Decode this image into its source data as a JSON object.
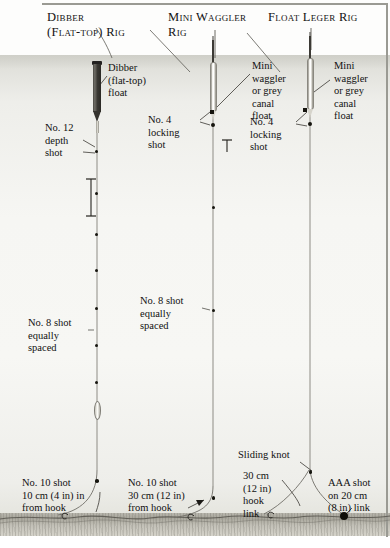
{
  "figure": {
    "kind": "angling-rig-diagram",
    "titles": [
      {
        "id": "dibber",
        "text": "Dibber\n(Flat-top) Rig"
      },
      {
        "id": "mini-waggler",
        "text": "Mini Waggler\nRig"
      },
      {
        "id": "float-leger",
        "text": "Float Leger Rig"
      }
    ]
  },
  "labels": {
    "dibber_float": "Dibber\n(flat-top)\nfloat",
    "no12_depth_shot": "No. 12\ndepth\nshot",
    "no8_shot_left": "No. 8 shot\nequally\nspaced",
    "no8_shot_mid": "No. 8 shot\nequally\nspaced",
    "no10_shot_left": "No. 10 shot\n10 cm (4 in) in\nfrom hook",
    "no10_shot_mid": "No. 10 shot\n30 cm (12 in)\nfrom hook",
    "mini_waggler_left": "Mini\nwaggler\nor grey\ncanal\nfloat",
    "mini_waggler_right": "Mini\nwaggler\nor grey\ncanal\nfloat",
    "no4_locking_left": "No. 4\nlocking\nshot",
    "no4_locking_right": "No. 4\nlocking\nshot",
    "sliding_knot": "Sliding knot",
    "hook_link": "30 cm\n(12 in)\nhook\nlink",
    "aaa_shot": "AAA shot\non 20 cm\n(8 in) link"
  },
  "colors": {
    "ink": "#111111",
    "line": "#8e8c85",
    "shot": "#16150f",
    "water_top": "#dcdcd6",
    "water_mid": "#f7f7f4",
    "bed": "#a9a79d",
    "float_dark": "#35332e",
    "float_light": "#ffffff"
  },
  "rigs": [
    {
      "name": "dibber-flat-top-rig",
      "line_x": 97,
      "line_top": 62,
      "line_bottom": 520,
      "float": {
        "type": "dibber-flat-top",
        "top": 61,
        "bottom": 133
      },
      "shots": [
        {
          "name": "no-12-depth-shot",
          "y": 152,
          "size": 3.2
        },
        {
          "name": "no-8-shot",
          "y": 194,
          "size": 3.2
        },
        {
          "name": "no-8-shot",
          "y": 235,
          "size": 3.2
        },
        {
          "name": "no-8-shot",
          "y": 271,
          "size": 3.2
        },
        {
          "name": "no-8-shot",
          "y": 309,
          "size": 3.2
        },
        {
          "name": "no-8-shot",
          "y": 346,
          "size": 3.2
        },
        {
          "name": "no-8-shot",
          "y": 383,
          "size": 3.2
        },
        {
          "name": "no-10-shot",
          "y": 481,
          "size": 3.4
        }
      ]
    },
    {
      "name": "mini-waggler-rig",
      "line_x": 213,
      "line_top": 40,
      "line_bottom": 520,
      "float": {
        "type": "mini-waggler",
        "antenna_top": 40,
        "body_top": 62,
        "body_bottom": 118
      },
      "shots": [
        {
          "name": "no-4-locking-shot",
          "y": 112,
          "size": 4
        },
        {
          "name": "no-4-locking-shot",
          "y": 124,
          "size": 4
        },
        {
          "name": "no-8-shot",
          "y": 208,
          "size": 3.2
        },
        {
          "name": "no-8-shot",
          "y": 311,
          "size": 3.2
        },
        {
          "name": "no-10-shot",
          "y": 498,
          "size": 3.4
        }
      ]
    },
    {
      "name": "float-leger-rig",
      "line_x": 310,
      "line_top": 36,
      "line_bottom": 520,
      "float": {
        "type": "mini-waggler",
        "antenna_top": 36,
        "body_top": 58,
        "body_bottom": 116
      },
      "shots": [
        {
          "name": "no-4-locking-shot",
          "y": 110,
          "size": 4
        },
        {
          "name": "no-4-locking-shot",
          "y": 124,
          "size": 4
        },
        {
          "name": "sliding-knot",
          "y": 473,
          "size": 3.4
        },
        {
          "name": "aaa-shot",
          "y": 518,
          "size": 7
        }
      ]
    }
  ]
}
